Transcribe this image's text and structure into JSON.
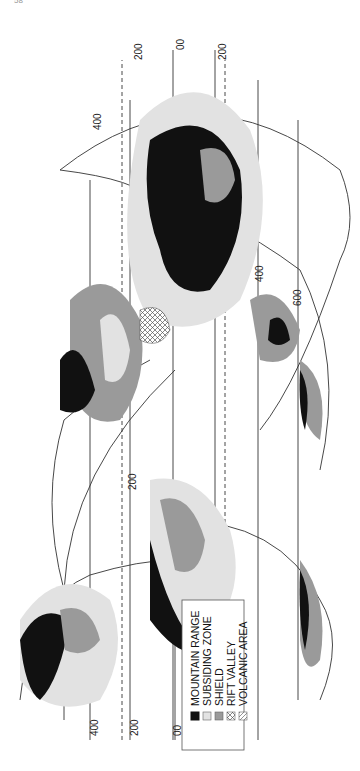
{
  "page": {
    "number_fragment": "58"
  },
  "figure": {
    "orientation": "rotated-90-ccw",
    "type": "interrupted world map of geological features",
    "latitude_labels": {
      "left_panel": [
        "400",
        "200",
        "00"
      ],
      "top_edge": [
        "200",
        "00",
        "200"
      ],
      "center": [
        "400",
        "200",
        "400",
        "600"
      ]
    },
    "legend": {
      "items": [
        {
          "label": "MOUNTAIN RANGE",
          "pattern": "solid-black",
          "color": "#111111"
        },
        {
          "label": "SUBSIDING ZONE",
          "pattern": "light-gray",
          "color": "#e2e2e2"
        },
        {
          "label": "SHIELD",
          "pattern": "mid-gray",
          "color": "#9a9a9a"
        },
        {
          "label": "RIFT VALLEY",
          "pattern": "crosshatch",
          "color": "#ffffff"
        },
        {
          "label": "VOLCANIC AREA",
          "pattern": "diagonal-hatch",
          "color": "#ffffff"
        }
      ]
    },
    "colors": {
      "mountain": "#111111",
      "subsiding": "#e2e2e2",
      "shield": "#9a9a9a",
      "line": "#444444"
    }
  }
}
